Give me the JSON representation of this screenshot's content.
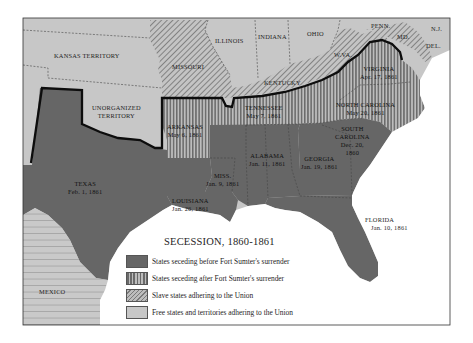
{
  "map": {
    "title": "SECESSION, 1860-1861",
    "colors": {
      "seceded_before": "#666666",
      "seceded_after_fg": "#6a6a6a",
      "seceded_after_bg": "#bdbdbd",
      "slave_union_bg": "#c4c4c4",
      "slave_union_hatch": "#7a7a7a",
      "free": "#c7c7c7",
      "water": "#ffffff",
      "border": "#111111"
    },
    "regions": {
      "kansas_territory": {
        "name": "KANSAS TERRITORY"
      },
      "unorganized_territory": {
        "name": "UNORGANIZED",
        "name2": "TERRITORY"
      },
      "missouri": {
        "name": "MISSOURI"
      },
      "illinois": {
        "name": "ILLINOIS"
      },
      "indiana": {
        "name": "INDIANA"
      },
      "ohio": {
        "name": "OHIO"
      },
      "penn": {
        "name": "PENN."
      },
      "nj": {
        "name": "N.J."
      },
      "md": {
        "name": "MD."
      },
      "del": {
        "name": "DEL."
      },
      "wva": {
        "name": "W.VA."
      },
      "kentucky": {
        "name": "KENTUCKY"
      },
      "virginia": {
        "name": "VIRGINIA",
        "date": "Apr. 17, 1861"
      },
      "north_carolina": {
        "name": "NORTH CAROLINA",
        "date": "May 20, 1861"
      },
      "tennessee": {
        "name": "TENNESSEE",
        "date": "May 7, 1861"
      },
      "arkansas": {
        "name": "ARKANSAS",
        "date": "May 6, 1861"
      },
      "south_carolina": {
        "name": "SOUTH",
        "name2": "CAROLINA",
        "date": "Dec. 20,",
        "date2": "1860"
      },
      "georgia": {
        "name": "GEORGIA",
        "date": "Jan. 19, 1861"
      },
      "alabama": {
        "name": "ALABAMA",
        "date": "Jan. 11, 1861"
      },
      "mississippi": {
        "name": "MISS.",
        "date": "Jan. 9, 1861"
      },
      "louisiana": {
        "name": "LOUISIANA",
        "date": "Jan. 26, 1861"
      },
      "texas": {
        "name": "TEXAS",
        "date": "Feb. 1, 1861"
      },
      "florida": {
        "name": "FLORIDA",
        "date": "Jan. 10, 1861"
      },
      "mexico": {
        "name": "MEXICO"
      }
    },
    "legend": [
      {
        "key": "seceded_before",
        "label": "States seceding before Fort Sumter's surrender"
      },
      {
        "key": "seceded_after",
        "label": "States seceding after Fort Sumter's surrender"
      },
      {
        "key": "slave_union",
        "label": "Slave states adhering to the Union"
      },
      {
        "key": "free",
        "label": "Free states and territories adhering to the Union"
      }
    ]
  }
}
